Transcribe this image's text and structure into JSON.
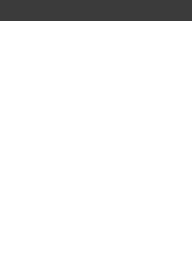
{
  "fret_label": "7 fr",
  "colors": {
    "band": "#3b3b3b",
    "grid": "#8a8a8a",
    "dot": "#333333",
    "square_stroke": "#777777"
  },
  "grid": {
    "strings": 6,
    "frets": 5,
    "string_x": [
      21,
      50,
      79,
      108,
      137,
      165
    ],
    "fret_y": [
      45,
      88,
      126,
      164,
      203,
      240
    ]
  },
  "markers": [
    {
      "fret": 1,
      "string": 3,
      "type": "dot"
    },
    {
      "fret": 1,
      "string": 4,
      "type": "dot"
    },
    {
      "fret": 1,
      "string": 5,
      "type": "square"
    },
    {
      "fret": 1,
      "string": 6,
      "type": "dot"
    },
    {
      "fret": 2,
      "string": 1,
      "type": "dot"
    },
    {
      "fret": 2,
      "string": 2,
      "type": "dot"
    },
    {
      "fret": 2,
      "string": 4,
      "type": "dot"
    },
    {
      "fret": 2,
      "string": 6,
      "type": "dot"
    },
    {
      "fret": 3,
      "string": 2,
      "type": "square"
    },
    {
      "fret": 3,
      "string": 3,
      "type": "dot"
    },
    {
      "fret": 3,
      "string": 5,
      "type": "dot"
    },
    {
      "fret": 4,
      "string": 1,
      "type": "dot"
    },
    {
      "fret": 4,
      "string": 3,
      "type": "dot"
    },
    {
      "fret": 4,
      "string": 4,
      "type": "dot"
    },
    {
      "fret": 4,
      "string": 5,
      "type": "dot"
    },
    {
      "fret": 4,
      "string": 6,
      "type": "dot"
    },
    {
      "fret": 5,
      "string": 1,
      "type": "dot"
    },
    {
      "fret": 5,
      "string": 2,
      "type": "dot"
    }
  ]
}
